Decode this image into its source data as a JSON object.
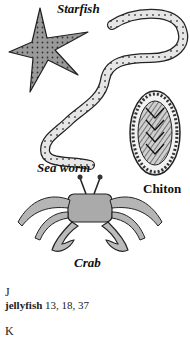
{
  "illustration": {
    "labels": {
      "starfish": "Starfish",
      "sea_worm": "Sea worm",
      "chiton": "Chiton",
      "crab": "Crab"
    }
  },
  "index": {
    "sections": [
      {
        "letter": "J",
        "entries": [
          {
            "term": "jellyfish",
            "pages": "13, 18, 37"
          }
        ]
      },
      {
        "letter": "K",
        "entries": []
      }
    ]
  }
}
